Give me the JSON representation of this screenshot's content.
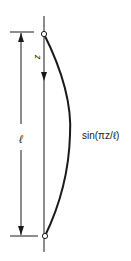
{
  "diagram": {
    "type": "column-buckling-mode-shape",
    "labels": {
      "z": "z",
      "length": "ℓ",
      "mode_shape": "sin(πz/ℓ)"
    },
    "colors": {
      "stroke": "#1a1a1a",
      "background": "#ffffff"
    },
    "elements": {
      "column_axis": "vertical straight line",
      "deflected_shape": "half sine wave curve bulging right",
      "supports": [
        "pin-top",
        "pin-bottom"
      ],
      "dimension": "length ℓ between supports with arrows",
      "coordinate_arrow": "z pointing downward"
    }
  }
}
